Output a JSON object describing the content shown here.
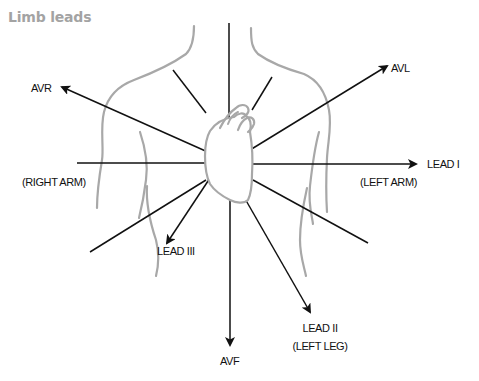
{
  "title": "Limb leads",
  "colors": {
    "lines": "#111111",
    "body_outline": "#a8a8a8",
    "heart_outline": "#a8a8a8",
    "title": "#a3a3a3"
  },
  "labels": {
    "avr": "AVR",
    "avl": "AVL",
    "lead_i": "LEAD I",
    "right_arm": "(RIGHT ARM)",
    "left_arm": "(LEFT ARM)",
    "lead_iii": "LEAD III",
    "lead_ii": "LEAD II",
    "left_leg": "(LEFT LEG)",
    "avf": "AVF"
  },
  "diagram": {
    "center": [
      230,
      160
    ],
    "leads": [
      {
        "name": "AVR",
        "arrow": true,
        "from": [
          210,
          153
        ],
        "to": [
          62,
          87
        ]
      },
      {
        "name": "AVL",
        "arrow": true,
        "from": [
          250,
          150
        ],
        "to": [
          387,
          66
        ]
      },
      {
        "name": "LEAD I",
        "arrow": true,
        "from": [
          250,
          164
        ],
        "to": [
          416,
          164
        ]
      },
      {
        "name": "LEAD III",
        "arrow": true,
        "from": [
          210,
          178
        ],
        "to": [
          167,
          243
        ]
      },
      {
        "name": "LEAD II",
        "arrow": true,
        "from": [
          240,
          190
        ],
        "to": [
          310,
          312
        ]
      },
      {
        "name": "AVF",
        "arrow": true,
        "from": [
          230,
          200
        ],
        "to": [
          230,
          345
        ]
      },
      {
        "name": "axis-top",
        "arrow": false,
        "from": [
          229,
          23
        ],
        "to": [
          229,
          140
        ]
      },
      {
        "name": "axis-left",
        "arrow": false,
        "from": [
          77,
          163
        ],
        "to": [
          207,
          163
        ]
      },
      {
        "name": "line-upper-left",
        "arrow": false,
        "from": [
          173,
          70
        ],
        "to": [
          204,
          110
        ]
      },
      {
        "name": "line-upper-right",
        "arrow": false,
        "from": [
          272,
          77
        ],
        "to": [
          252,
          110
        ]
      },
      {
        "name": "line-lower-left",
        "arrow": false,
        "from": [
          90,
          252
        ],
        "to": [
          205,
          180
        ]
      },
      {
        "name": "line-lower-right",
        "arrow": false,
        "from": [
          253,
          180
        ],
        "to": [
          368,
          243
        ]
      }
    ]
  }
}
